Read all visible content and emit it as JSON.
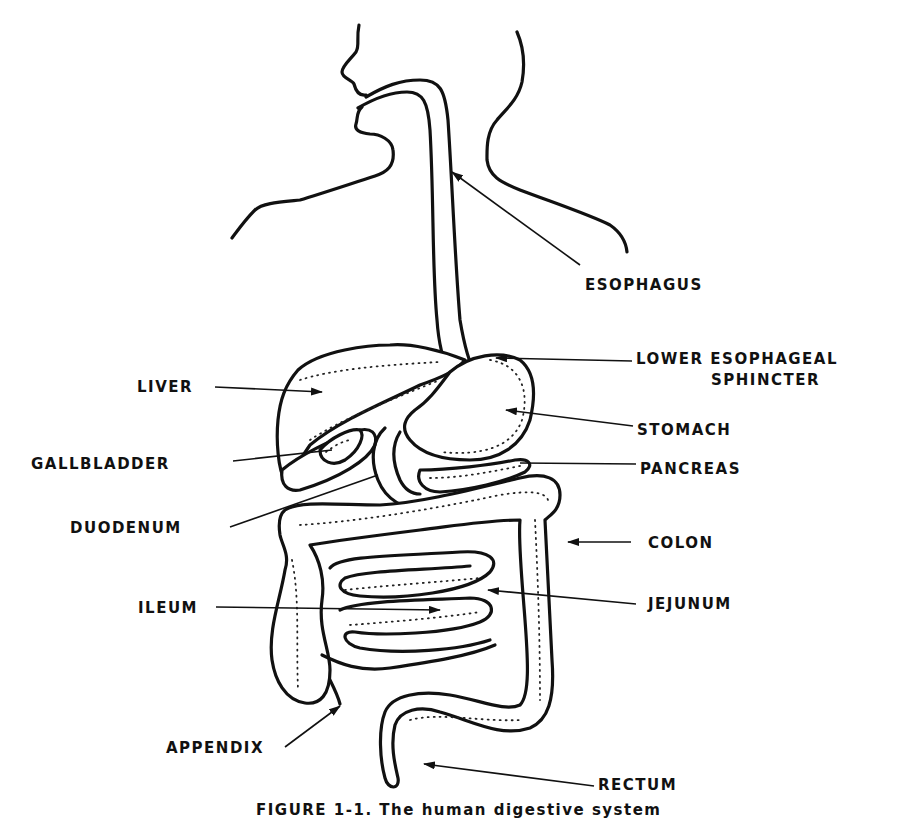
{
  "figure": {
    "caption": "FIGURE 1-1. The human digestive system",
    "labels": {
      "esophagus": "ESOPHAGUS",
      "lower_esophageal_sphincter_line1": "LOWER   ESOPHAGEAL",
      "lower_esophageal_sphincter_line2": "SPHINCTER",
      "liver": "LIVER",
      "stomach": "STOMACH",
      "gallbladder": "GALLBLADDER",
      "pancreas": "PANCREAS",
      "duodenum": "DUODENUM",
      "colon": "COLON",
      "ileum": "ILEUM",
      "jejunum": "JEJUNUM",
      "appendix": "APPENDIX",
      "rectum": "RECTUM"
    }
  }
}
